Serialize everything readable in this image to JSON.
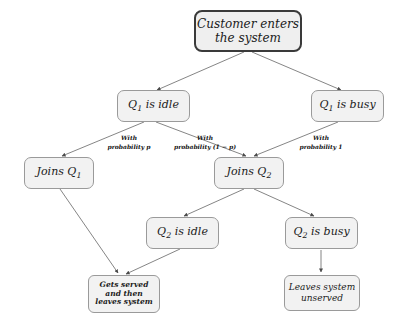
{
  "diagram": {
    "colors": {
      "node_fill": "#f2f2f2",
      "node_border": "#9a9a9a",
      "root_border": "#3a3a3a",
      "edge": "#555555",
      "text": "#1b1b1b",
      "background": "#ffffff"
    },
    "nodes": [
      {
        "id": "root",
        "name": "customer-enters",
        "line1": "Customer enters",
        "line2": "the system"
      },
      {
        "id": "q1_idle",
        "name": "q1-is-idle",
        "prefix": "Q",
        "sub": "1",
        "suffix": " is idle"
      },
      {
        "id": "q1_busy",
        "name": "q1-is-busy",
        "prefix": "Q",
        "sub": "1",
        "suffix": " is busy"
      },
      {
        "id": "joins_q1",
        "name": "joins-q1",
        "prefix": "Joins Q",
        "sub": "1",
        "suffix": ""
      },
      {
        "id": "joins_q2",
        "name": "joins-q2",
        "prefix": "Joins Q",
        "sub": "2",
        "suffix": ""
      },
      {
        "id": "q2_idle",
        "name": "q2-is-idle",
        "prefix": "Q",
        "sub": "2",
        "suffix": " is idle"
      },
      {
        "id": "q2_busy",
        "name": "q2-is-busy",
        "prefix": "Q",
        "sub": "2",
        "suffix": " is busy"
      },
      {
        "id": "served",
        "name": "gets-served-and-leaves",
        "line1": "Gets served",
        "line2": "and then",
        "line3": "leaves system"
      },
      {
        "id": "unserved",
        "name": "leaves-system-unserved",
        "line1": "Leaves system",
        "line2": "unserved"
      }
    ],
    "edge_labels": [
      {
        "id": "label_p",
        "name": "edge-label-probability-p",
        "line1": "With",
        "line2": "probability p"
      },
      {
        "id": "label_1mp",
        "name": "edge-label-probability-1-minus-p",
        "line1": "With",
        "line2": "probability (1 − p)"
      },
      {
        "id": "label_1",
        "name": "edge-label-probability-1",
        "line1": "With",
        "line2": "probability 1"
      }
    ],
    "edges": [
      {
        "from": "root",
        "to": "q1_idle"
      },
      {
        "from": "root",
        "to": "q1_busy"
      },
      {
        "from": "q1_idle",
        "to": "joins_q1",
        "label": "With probability p"
      },
      {
        "from": "q1_idle",
        "to": "joins_q2",
        "label": "With probability (1 − p)"
      },
      {
        "from": "q1_busy",
        "to": "joins_q2",
        "label": "With probability 1"
      },
      {
        "from": "joins_q1",
        "to": "served"
      },
      {
        "from": "joins_q2",
        "to": "q2_idle"
      },
      {
        "from": "joins_q2",
        "to": "q2_busy"
      },
      {
        "from": "q2_idle",
        "to": "served"
      },
      {
        "from": "q2_busy",
        "to": "unserved"
      }
    ]
  }
}
